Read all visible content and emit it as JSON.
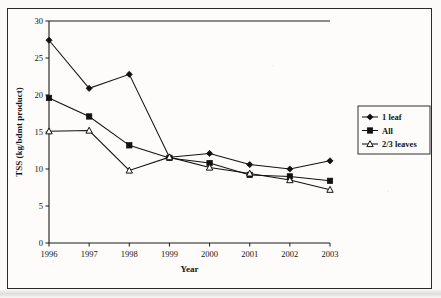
{
  "figure": {
    "top_cut_caption": "",
    "frame_color": "#2a2a2a",
    "background": "#fdfcfa"
  },
  "axes": {
    "x_title": "Year",
    "y_title": "TSS (kg/bdmt product)",
    "x_tick_labels": [
      "1996",
      "1997",
      "1998",
      "1999",
      "2000",
      "2001",
      "2002",
      "2003"
    ],
    "y_tick_labels": [
      "0",
      "5",
      "10",
      "15",
      "20",
      "25",
      "30"
    ]
  },
  "legend": {
    "position": "right-outside",
    "items": [
      {
        "label": "1 leaf",
        "marker": "filled-diamond",
        "color": "#111111"
      },
      {
        "label": "All",
        "marker": "filled-square",
        "color": "#111111"
      },
      {
        "label": "2/3 leaves",
        "marker": "open-triangle",
        "color": "#111111"
      }
    ]
  },
  "chart_data": {
    "type": "line",
    "title": "",
    "xlabel": "Year",
    "ylabel": "TSS (kg/bdmt product)",
    "categories": [
      "1996",
      "1997",
      "1998",
      "1999",
      "2000",
      "2001",
      "2002",
      "2003"
    ],
    "x": [
      1996,
      1997,
      1998,
      1999,
      2000,
      2001,
      2002,
      2003
    ],
    "xlim": [
      1996,
      2003
    ],
    "ylim": [
      0,
      30
    ],
    "ytick_step": 5,
    "grid": false,
    "legend_position": "right-outside",
    "series": [
      {
        "name": "1 leaf",
        "marker": "filled-diamond",
        "color": "#111111",
        "values": [
          27.4,
          20.9,
          22.8,
          11.6,
          12.1,
          10.6,
          10.0,
          11.1
        ]
      },
      {
        "name": "All",
        "marker": "filled-square",
        "color": "#111111",
        "values": [
          19.6,
          17.1,
          13.2,
          11.5,
          10.8,
          9.2,
          9.0,
          8.4
        ]
      },
      {
        "name": "2/3 leaves",
        "marker": "open-triangle",
        "color": "#111111",
        "values": [
          15.1,
          15.2,
          9.8,
          11.6,
          10.2,
          9.4,
          8.5,
          7.2
        ]
      }
    ]
  }
}
